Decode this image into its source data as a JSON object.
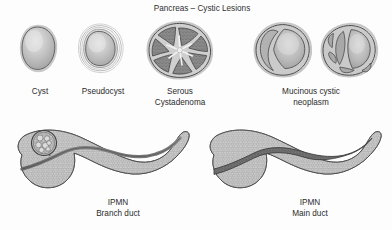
{
  "figure": {
    "title": "Pancreas – Cystic Lesions",
    "background_color": "#fdfdfd",
    "text_color": "#2b2b2b"
  },
  "palette": {
    "outline": "#4a4a4a",
    "tissue_light": "#d8d8d8",
    "tissue_mid": "#b6b6b6",
    "tissue_dark": "#8e8e8e",
    "duct_dark": "#6e6e6e",
    "lobule_dark": "#7a7a7a",
    "highlight": "#ececec",
    "capsule": "#cfcfcf"
  },
  "top_row": {
    "items": [
      {
        "id": "cyst",
        "label_lines": [
          "Cyst"
        ],
        "label_x": 40,
        "label_y": 94,
        "description": "smooth unilocular oval cyst with simple thin wall"
      },
      {
        "id": "pseudocyst",
        "label_lines": [
          "Pseudocyst"
        ],
        "label_x": 103,
        "label_y": 94,
        "description": "cyst surrounded by several concentric fibrous capsule layers"
      },
      {
        "id": "serous-cystadenoma",
        "label_lines": [
          "Serous",
          "Cystadenoma"
        ],
        "label_x": 180,
        "label_y": 94,
        "description": "microcystic honeycomb lesion with radiating lobules and central stellate scar"
      },
      {
        "id": "mucinous-cystic-neoplasm",
        "label_lines": [
          "Mucinous cystic",
          "neoplasm"
        ],
        "label_x": 311,
        "label_y": 94,
        "description": "two macrocystic lesions, one with a single daughter cyst and one multiloculated"
      }
    ]
  },
  "bottom_row": {
    "items": [
      {
        "id": "ipmn-branch-duct",
        "label_lines": [
          "IPMN",
          "Branch duct"
        ],
        "label_x": 118,
        "label_y": 205,
        "description": "pancreas with grape-like cluster of cysts in the head communicating with a side branch; main duct normal calibre"
      },
      {
        "id": "ipmn-main-duct",
        "label_lines": [
          "IPMN",
          "Main duct"
        ],
        "label_x": 310,
        "label_y": 205,
        "description": "pancreas with diffusely dilated main pancreatic duct filled with mucin"
      }
    ]
  }
}
